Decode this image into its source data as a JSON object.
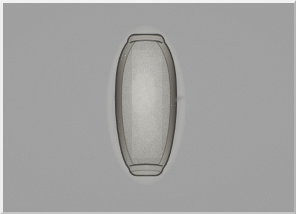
{
  "image": {
    "kind": "photomicrograph",
    "modality": "brightfield light microscopy",
    "subject_label": "parasite egg (helminth ovum)",
    "alt_text": "Brightfield photomicrograph of a single elongated barrel-shaped parasite egg with truncated poles, a thick speckled shell wall and granular internal contents, centered on a plain gray microscope field.",
    "width_px": 296,
    "height_px": 214,
    "has_text_overlay": false,
    "has_scale_bar": false,
    "has_legend": false
  },
  "background": {
    "field_color": "#9b9b9b",
    "field_description": "uniform mid-gray out-of-focus background",
    "vignette": true,
    "grain": true
  },
  "border": {
    "present": true,
    "top_color": "#f2f2f2",
    "left_color": "#eeeeee",
    "right_color": "#b4b4b4",
    "bottom_color": "#c4c4c4",
    "top_width_px": 3,
    "left_width_px": 3,
    "right_width_px": 2,
    "bottom_width_px": 2
  },
  "specimen": {
    "name": "parasite-egg",
    "shape": "elongated ovoid / barrel with truncated poles",
    "bbox": {
      "x": 112,
      "y": 32,
      "width": 68,
      "height": 146
    },
    "center": {
      "x": 146,
      "y": 105
    },
    "long_axis_px": 146,
    "short_axis_px": 66,
    "orientation": "vertical",
    "colors": {
      "shell_outline": "#3a3733",
      "shell_wall": "#6e6a64",
      "shell_inner_layer": "#8a867f",
      "interior_base": "#a4a29c",
      "interior_highlight": "#c3c1bb",
      "granule_dark": "#4a4742",
      "halo": "#b6b5b0"
    },
    "features": [
      {
        "name": "anterior-pole-cap",
        "label": "operculum-like cap at upper pole",
        "position": "top",
        "description": "flattened truncated apex with a narrow transverse cap band"
      },
      {
        "name": "posterior-pole",
        "label": "flattened posterior pole",
        "position": "bottom",
        "description": "broad truncated base with dense dark granulation"
      },
      {
        "name": "shell-wall",
        "label": "thick double-layered shell wall",
        "position": "perimeter",
        "description": "dark punctate speckling along both lateral walls"
      },
      {
        "name": "internal-granular-mass",
        "label": "granular internal contents",
        "position": "center",
        "description": "mottled yolk/embryonic granules filling the lumen"
      },
      {
        "name": "lateral-protrusion",
        "label": "small refractile protrusion on right wall",
        "position": "right-middle",
        "description": "faint spur-like artifact at mid-height of the right margin"
      }
    ]
  }
}
